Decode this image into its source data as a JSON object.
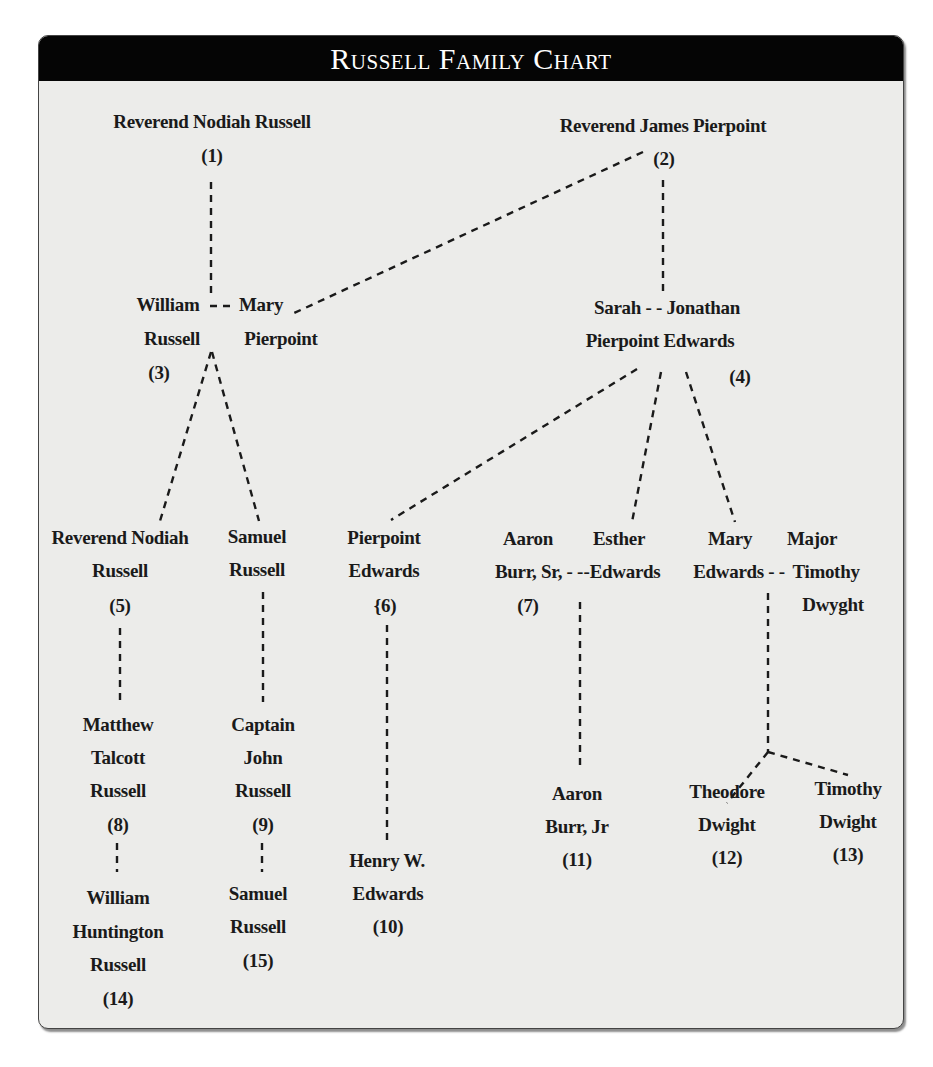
{
  "title": "Russell Family Chart",
  "colors": {
    "header_bg": "#050505",
    "header_text": "#ffffff",
    "panel_bg": "#ececea",
    "text": "#1a1a1a"
  },
  "people": {
    "p1": {
      "lines": [
        "Reverend Nodiah Russell"
      ],
      "num": "(1)"
    },
    "p2": {
      "lines": [
        "Reverend James Pierpoint"
      ],
      "num": "(2)"
    },
    "p3": {
      "lines": [
        "William",
        "Russell"
      ],
      "num": "(3)"
    },
    "p3s": {
      "lines": [
        "Mary",
        "Pierpoint"
      ]
    },
    "p4s": {
      "lines": [
        "Sarah - - Jonathan",
        "Pierpoint  Edwards"
      ],
      "num": "(4)"
    },
    "p5": {
      "lines": [
        "Reverend Nodiah",
        "Russell"
      ],
      "num": "(5)"
    },
    "samuel": {
      "lines": [
        "Samuel",
        "Russell"
      ]
    },
    "p6": {
      "lines": [
        "Pierpoint",
        "Edwards"
      ],
      "num": "{6)"
    },
    "p7": {
      "lines": [
        "Aaron",
        "Burr, Sr, - -"
      ],
      "num": "(7)"
    },
    "esther": {
      "lines": [
        "Esther",
        "-Edwards"
      ]
    },
    "maryE": {
      "lines": [
        "Mary",
        "Edwards - -"
      ]
    },
    "major": {
      "lines": [
        "Major",
        "Timothy",
        "Dwyght"
      ]
    },
    "p8": {
      "lines": [
        "Matthew",
        "Talcott",
        "Russell"
      ],
      "num": "(8)"
    },
    "p9": {
      "lines": [
        "Captain",
        "John",
        "Russell"
      ],
      "num": "(9)"
    },
    "p10": {
      "lines": [
        "Henry W.",
        "Edwards"
      ],
      "num": "(10)"
    },
    "p11": {
      "lines": [
        "Aaron",
        "Burr, Jr"
      ],
      "num": "(11)"
    },
    "p12": {
      "lines": [
        "Theodore",
        "Dwight"
      ],
      "num": "(12)"
    },
    "p13": {
      "lines": [
        "Timothy",
        "Dwight"
      ],
      "num": "(13)"
    },
    "p14": {
      "lines": [
        "William",
        "Huntington",
        "Russell"
      ],
      "num": "(14)"
    },
    "p15": {
      "lines": [
        "Samuel",
        "Russell"
      ],
      "num": "(15)"
    }
  },
  "connectors": {
    "spouse_3": "- -"
  }
}
